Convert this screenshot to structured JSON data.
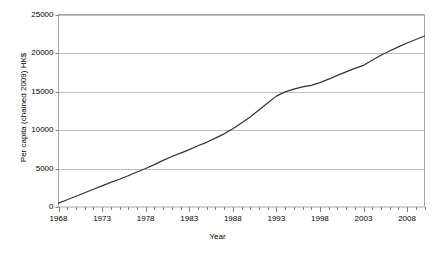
{
  "chart_data": {
    "type": "line",
    "title": "",
    "xlabel": "Year",
    "ylabel": "Per capita (chained 2009) HK$",
    "xlim": [
      1968,
      2010
    ],
    "ylim": [
      0,
      25000
    ],
    "grid": "horizontal",
    "legend": "none",
    "y_ticks": [
      0,
      5000,
      10000,
      15000,
      20000,
      25000
    ],
    "y_tick_labels": [
      "0",
      "5000",
      "10000",
      "15000",
      "20000",
      "25000"
    ],
    "x_ticks": [
      1968,
      1973,
      1978,
      1983,
      1988,
      1993,
      1998,
      2003,
      2008
    ],
    "x_tick_labels": [
      "1968",
      "1973",
      "1978",
      "1983",
      "1988",
      "1993",
      "1998",
      "2003",
      "2008"
    ],
    "x_minor_tick_interval": 1,
    "line_color": "#333333",
    "series": [
      {
        "name": "Per capita GDP",
        "x": [
          1968,
          1969,
          1970,
          1971,
          1972,
          1973,
          1974,
          1975,
          1976,
          1977,
          1978,
          1979,
          1980,
          1981,
          1982,
          1983,
          1984,
          1985,
          1986,
          1987,
          1988,
          1989,
          1990,
          1991,
          1992,
          1993,
          1994,
          1995,
          1996,
          1997,
          1998,
          1999,
          2000,
          2001,
          2002,
          2003,
          2004,
          2005,
          2006,
          2007,
          2008,
          2009,
          2010
        ],
        "values": [
          500,
          950,
          1400,
          1850,
          2300,
          2750,
          3200,
          3600,
          4050,
          4550,
          5000,
          5500,
          6050,
          6550,
          7000,
          7450,
          7950,
          8400,
          8950,
          9500,
          10150,
          10900,
          11700,
          12600,
          13500,
          14400,
          14950,
          15300,
          15600,
          15800,
          16150,
          16600,
          17100,
          17550,
          18000,
          18400,
          19050,
          19700,
          20250,
          20800,
          21300,
          21750,
          22200
        ]
      }
    ]
  }
}
